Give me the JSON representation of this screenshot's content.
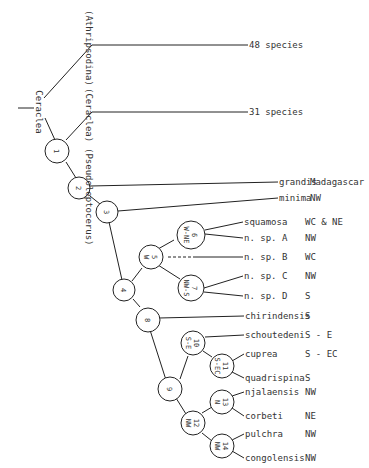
{
  "root_label": "Ceraclea",
  "subgenera": [
    {
      "label": "(Athripsodina)",
      "terminal": "48 species"
    },
    {
      "label": "(Ceraclea)",
      "terminal": "31 species"
    },
    {
      "label": "(Pseudoleptocerus)"
    }
  ],
  "nodes": [
    {
      "id": "1",
      "region": ""
    },
    {
      "id": "2",
      "region": ""
    },
    {
      "id": "3",
      "region": ""
    },
    {
      "id": "4",
      "region": ""
    },
    {
      "id": "5",
      "region": "W"
    },
    {
      "id": "6",
      "region": "W-NE"
    },
    {
      "id": "7",
      "region": "NW-S"
    },
    {
      "id": "8",
      "region": ""
    },
    {
      "id": "9",
      "region": ""
    },
    {
      "id": "10",
      "region": "S-E"
    },
    {
      "id": "11",
      "region": "S-EC"
    },
    {
      "id": "12",
      "region": "NW"
    },
    {
      "id": "13",
      "region": "N"
    },
    {
      "id": "14",
      "region": "NW"
    }
  ],
  "taxa": [
    {
      "name": "grandis",
      "distribution": "Madagascar"
    },
    {
      "name": "minima",
      "distribution": "NW"
    },
    {
      "name": "squamosa",
      "distribution": "WC & NE"
    },
    {
      "name": "n. sp. A",
      "distribution": "NW"
    },
    {
      "name": "n. sp. B",
      "distribution": "WC"
    },
    {
      "name": "n. sp. C",
      "distribution": "NW"
    },
    {
      "name": "n. sp. D",
      "distribution": "S"
    },
    {
      "name": "chirindensis",
      "distribution": "S"
    },
    {
      "name": "schoutedeni",
      "distribution": "S - E"
    },
    {
      "name": "cuprea",
      "distribution": "S - EC"
    },
    {
      "name": "quadrispina",
      "distribution": "S"
    },
    {
      "name": "njalaensis",
      "distribution": "NW"
    },
    {
      "name": "corbeti",
      "distribution": "NE"
    },
    {
      "name": "pulchra",
      "distribution": "NW"
    },
    {
      "name": "congolensis",
      "distribution": "NW"
    }
  ]
}
